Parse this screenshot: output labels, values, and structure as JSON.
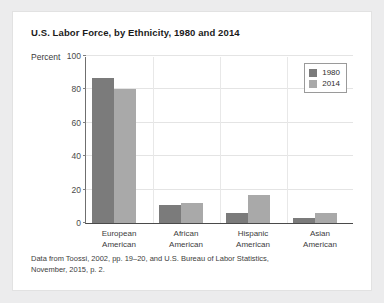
{
  "card": {
    "title": "U.S. Labor Force, by Ethnicity, 1980 and 2014",
    "source_line_1": "Data from Toossi, 2002, pp. 19–20, and U.S. Bureau of Labor Statistics,",
    "source_line_2": "November, 2015, p. 2."
  },
  "chart_data": {
    "type": "bar",
    "title": "U.S. Labor Force, by Ethnicity, 1980 and 2014",
    "xlabel": "",
    "ylabel": "Percent",
    "ylim": [
      0,
      100
    ],
    "yticks": [
      0,
      20,
      40,
      60,
      80,
      100
    ],
    "ytick_labels": [
      "0",
      "20",
      "40",
      "60",
      "80",
      "100"
    ],
    "grid": true,
    "legend_position": "top-right",
    "categories": [
      {
        "line1": "European",
        "line2": "American"
      },
      {
        "line1": "African",
        "line2": "American"
      },
      {
        "line1": "Hispanic",
        "line2": "American"
      },
      {
        "line1": "Asian",
        "line2": "American"
      }
    ],
    "series": [
      {
        "name": "1980",
        "color": "#7b7b7b",
        "values": [
          87,
          11,
          6,
          3
        ]
      },
      {
        "name": "2014",
        "color": "#a9a9a9",
        "values": [
          80,
          12,
          17,
          6
        ]
      }
    ]
  }
}
